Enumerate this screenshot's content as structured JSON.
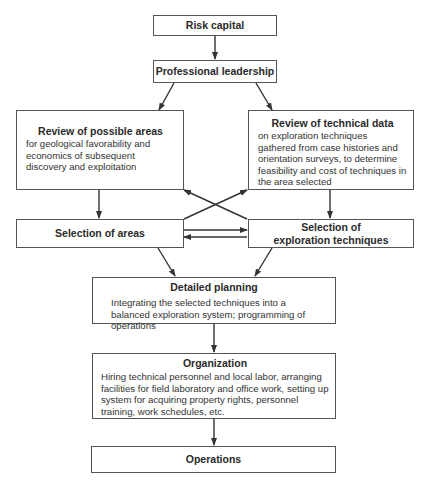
{
  "diagram": {
    "nodes": {
      "risk_capital": {
        "title": "Risk capital"
      },
      "professional_leadership": {
        "title": "Professional leadership"
      },
      "review_areas": {
        "title": "Review of possible areas",
        "desc": "for geological favorability and economics of subsequent discovery and exploitation"
      },
      "review_technical": {
        "title": "Review of technical data",
        "desc": "on exploration techniques gathered from case histories and orientation surveys, to determine feasibility and cost of techniques in the area selected"
      },
      "selection_areas": {
        "title": "Selection of areas"
      },
      "selection_techniques": {
        "title_line1": "Selection of",
        "title_line2": "exploration techniques"
      },
      "detailed_planning": {
        "title": "Detailed planning",
        "desc": "Integrating the selected techniques into a balanced exploration system;  programming of operations"
      },
      "organization": {
        "title": "Organization",
        "desc": "Hiring technical personnel and local labor, arranging facilities for field laboratory and office work, setting up system for acquiring property rights, personnel training, work schedules, etc."
      },
      "operations": {
        "title": "Operations"
      }
    },
    "edges": [
      {
        "from": "Risk capital",
        "to": "Professional leadership"
      },
      {
        "from": "Professional leadership",
        "to": "Review of possible areas"
      },
      {
        "from": "Professional leadership",
        "to": "Review of technical data"
      },
      {
        "from": "Review of possible areas",
        "to": "Selection of areas"
      },
      {
        "from": "Review of technical data",
        "to": "Selection of exploration techniques"
      },
      {
        "from": "Selection of areas",
        "to": "Review of technical data"
      },
      {
        "from": "Selection of exploration techniques",
        "to": "Review of possible areas"
      },
      {
        "from": "Selection of areas",
        "to": "Selection of exploration techniques"
      },
      {
        "from": "Selection of exploration techniques",
        "to": "Selection of areas"
      },
      {
        "from": "Selection of areas",
        "to": "Detailed planning"
      },
      {
        "from": "Selection of exploration techniques",
        "to": "Detailed planning"
      },
      {
        "from": "Detailed planning",
        "to": "Organization"
      },
      {
        "from": "Organization",
        "to": "Operations"
      }
    ],
    "colors": {
      "line": "#333333",
      "border": "#555555",
      "background": "#ffffff"
    }
  }
}
